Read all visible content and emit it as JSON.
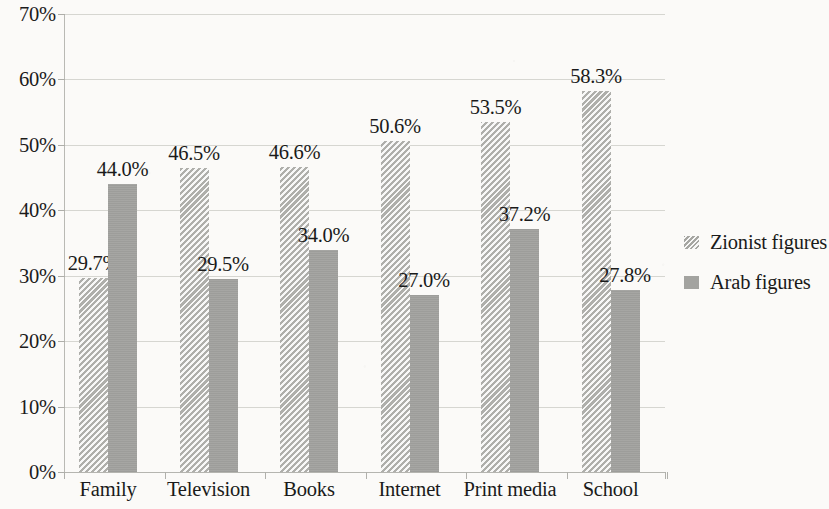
{
  "chart_data": {
    "type": "bar",
    "title": "",
    "subtitle": "",
    "xlabel": "",
    "ylabel": "",
    "ylim": [
      0,
      70
    ],
    "ytick_step": 10,
    "ytick_labels": [
      "0%",
      "10%",
      "20%",
      "30%",
      "40%",
      "50%",
      "60%",
      "70%"
    ],
    "grid": true,
    "grid_axis": "y",
    "legend_position": "right",
    "value_labels": true,
    "value_label_format": "0.0%",
    "categories": [
      "Family",
      "Television",
      "Books",
      "Internet",
      "Print media",
      "School"
    ],
    "series": [
      {
        "name": "Zionist figures",
        "color": "#cdcdc9",
        "pattern": "diagonal-hatch",
        "values": [
          29.7,
          46.5,
          46.6,
          50.6,
          53.5,
          58.3
        ],
        "labels": [
          "29.7%",
          "46.5%",
          "46.6%",
          "50.6%",
          "53.5%",
          "58.3%"
        ]
      },
      {
        "name": "Arab figures",
        "color": "#a3a3a0",
        "pattern": "solid",
        "values": [
          44.0,
          29.5,
          34.0,
          27.0,
          37.2,
          27.8
        ],
        "labels": [
          "44.0%",
          "29.5%",
          "34.0%",
          "27.0%",
          "37.2%",
          "27.8%"
        ]
      }
    ]
  },
  "legend": {
    "items": [
      {
        "label": "Zionist figures",
        "swatch": "diagonal-hatch"
      },
      {
        "label": "Arab figures",
        "swatch": "solid"
      }
    ]
  }
}
